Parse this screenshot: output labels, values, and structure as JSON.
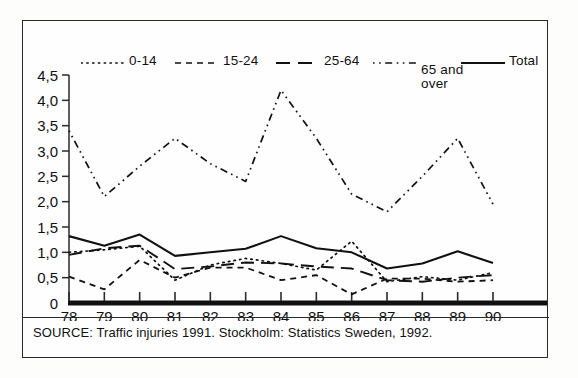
{
  "figure": {
    "source_note": "SOURCE: Traffic injuries 1991. Stockholm: Statistics Sweden, 1992."
  },
  "legend": {
    "entries": [
      {
        "label": "0-14",
        "style": "dotted",
        "sample": "0-14-sample"
      },
      {
        "label": "15-24",
        "style": "dashed",
        "sample": "15-24-sample"
      },
      {
        "label": "25-64",
        "style": "longdash",
        "sample": "25-64-sample"
      },
      {
        "label": "65 and over",
        "style": "dashdot",
        "sample": "65-and-over-sample"
      },
      {
        "label": "Total",
        "style": "solid",
        "sample": "total-sample"
      }
    ]
  },
  "chart_data": {
    "type": "line",
    "title": "",
    "xlabel": "",
    "ylabel": "",
    "x": [
      "78",
      "79",
      "80",
      "81",
      "82",
      "83",
      "84",
      "85",
      "86",
      "87",
      "88",
      "89",
      "90"
    ],
    "categories": [
      "78",
      "79",
      "80",
      "81",
      "82",
      "83",
      "84",
      "85",
      "86",
      "87",
      "88",
      "89",
      "90"
    ],
    "ytick_labels": [
      "0",
      "0,5",
      "1,0",
      "1,5",
      "2,0",
      "2,5",
      "3,0",
      "3,5",
      "4,0",
      "4,5"
    ],
    "ytick_values": [
      0,
      0.5,
      1.0,
      1.5,
      2.0,
      2.5,
      3.0,
      3.5,
      4.0,
      4.5
    ],
    "ylim": [
      0,
      4.5
    ],
    "grid": false,
    "legend_position": "top",
    "series": [
      {
        "name": "0-14",
        "style": "dotted",
        "color": "#111111",
        "values": [
          1.0,
          1.05,
          1.12,
          0.45,
          0.75,
          0.88,
          0.78,
          0.65,
          1.22,
          0.42,
          0.52,
          0.45,
          0.6
        ]
      },
      {
        "name": "15-24",
        "style": "dashed",
        "color": "#111111",
        "values": [
          0.52,
          0.27,
          0.85,
          0.5,
          0.7,
          0.7,
          0.45,
          0.55,
          0.17,
          0.48,
          0.48,
          0.42,
          0.45
        ]
      },
      {
        "name": "25-64",
        "style": "longdash",
        "color": "#111111",
        "values": [
          0.95,
          1.08,
          1.13,
          0.67,
          0.72,
          0.8,
          0.78,
          0.72,
          0.68,
          0.45,
          0.42,
          0.5,
          0.55
        ]
      },
      {
        "name": "65 and over",
        "style": "dashdot",
        "color": "#111111",
        "values": [
          3.4,
          2.1,
          2.7,
          3.25,
          2.75,
          2.4,
          4.2,
          3.25,
          2.15,
          1.8,
          2.5,
          3.25,
          1.95
        ]
      },
      {
        "name": "Total",
        "style": "solid",
        "color": "#111111",
        "values": [
          1.32,
          1.13,
          1.35,
          0.93,
          1.0,
          1.07,
          1.32,
          1.08,
          1.0,
          0.68,
          0.78,
          1.02,
          0.79
        ]
      }
    ]
  }
}
